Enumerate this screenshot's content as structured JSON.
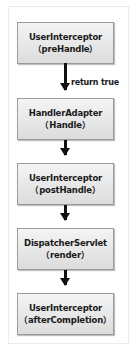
{
  "diagram": {
    "nodes": [
      {
        "title": "UserInterceptor",
        "subtitle": "（preHandle）"
      },
      {
        "title": "HandlerAdapter",
        "subtitle": "（Handle）"
      },
      {
        "title": "UserInterceptor",
        "subtitle": "（postHandle）"
      },
      {
        "title": "DispatcherServlet",
        "subtitle": "（render）"
      },
      {
        "title": "UserInterceptor",
        "subtitle": "（afterCompletion）"
      }
    ],
    "edges": [
      {
        "from": 0,
        "to": 1,
        "label": "return true"
      },
      {
        "from": 1,
        "to": 2,
        "label": ""
      },
      {
        "from": 2,
        "to": 3,
        "label": ""
      },
      {
        "from": 3,
        "to": 4,
        "label": ""
      }
    ],
    "colors": {
      "box_fill": "#e6e6e6",
      "box_border": "#9a9a9a",
      "arrow": "#111111",
      "text": "#1a1a1a"
    }
  }
}
